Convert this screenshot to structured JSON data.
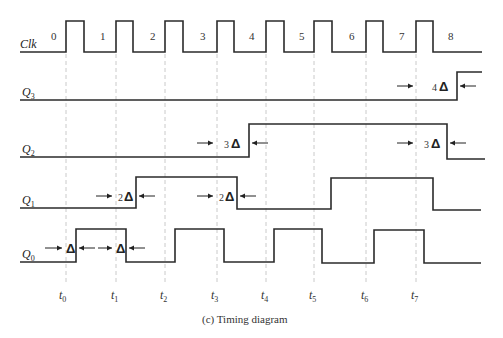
{
  "diagram": {
    "type": "timing-diagram",
    "caption": "(c)  Timing diagram",
    "clock": {
      "label": "Clk",
      "period_labels": [
        "0",
        "1",
        "2",
        "3",
        "4",
        "5",
        "6",
        "7",
        "8"
      ]
    },
    "signals": [
      {
        "name": "Q3",
        "base": "Q",
        "sub": "3"
      },
      {
        "name": "Q2",
        "base": "Q",
        "sub": "2"
      },
      {
        "name": "Q1",
        "base": "Q",
        "sub": "1"
      },
      {
        "name": "Q0",
        "base": "Q",
        "sub": "0"
      }
    ],
    "time_markers": [
      {
        "base": "t",
        "sub": "0"
      },
      {
        "base": "t",
        "sub": "1"
      },
      {
        "base": "t",
        "sub": "2"
      },
      {
        "base": "t",
        "sub": "3"
      },
      {
        "base": "t",
        "sub": "4"
      },
      {
        "base": "t",
        "sub": "5"
      },
      {
        "base": "t",
        "sub": "6"
      },
      {
        "base": "t",
        "sub": "7"
      }
    ],
    "delays": {
      "q0_a": {
        "mult": "",
        "sym": "Δ"
      },
      "q0_b": {
        "mult": "",
        "sym": "Δ"
      },
      "q1_a": {
        "mult": "2",
        "sym": "Δ"
      },
      "q1_b": {
        "mult": "2",
        "sym": "Δ"
      },
      "q2_a": {
        "mult": "3",
        "sym": "Δ"
      },
      "q2_b": {
        "mult": "3",
        "sym": "Δ"
      },
      "q3_a": {
        "mult": "4",
        "sym": "Δ"
      }
    }
  }
}
